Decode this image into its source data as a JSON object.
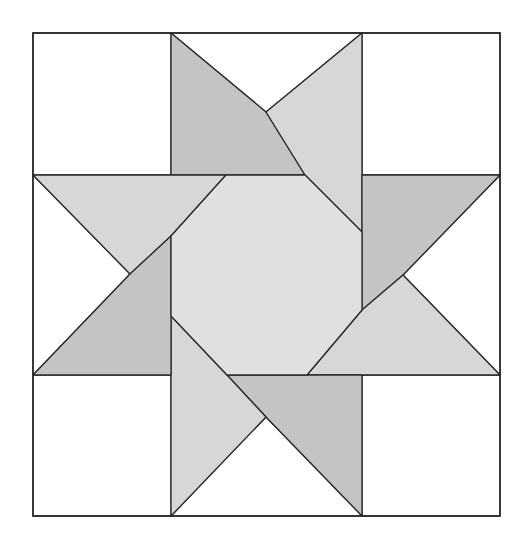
{
  "diagram": {
    "colors": {
      "background": "#ffffff",
      "white": "#ffffff",
      "dark": "#c4c4c4",
      "light": "#d7d7d7",
      "center": "#e0e0e0",
      "stroke": "#2a2a2a"
    },
    "grid": {
      "x": [
        33,
        171,
        362,
        500
      ],
      "y": [
        33,
        175,
        375,
        516
      ]
    },
    "pieces": [
      {
        "name": "corner-top-left",
        "fill": "white",
        "points": "33,33 171,33 171,175 33,175"
      },
      {
        "name": "corner-top-right",
        "fill": "white",
        "points": "362,33 500,33 500,175 362,175"
      },
      {
        "name": "corner-bottom-left",
        "fill": "white",
        "points": "33,375 171,375 171,516 33,516"
      },
      {
        "name": "corner-bottom-right",
        "fill": "white",
        "points": "362,375 500,375 500,516 362,516"
      },
      {
        "name": "top-background-triangle",
        "fill": "white",
        "points": "171,33 362,33 266,112"
      },
      {
        "name": "top-star-point-dark",
        "fill": "dark",
        "points": "171,33 266,112 305,175 171,175"
      },
      {
        "name": "top-star-point-light",
        "fill": "light",
        "points": "362,33 362,232 305,175 266,112"
      },
      {
        "name": "right-background-triangle",
        "fill": "white",
        "points": "500,175 500,375 403,275"
      },
      {
        "name": "right-star-point-dark",
        "fill": "dark",
        "points": "362,175 500,175 403,275 362,310"
      },
      {
        "name": "right-star-point-light",
        "fill": "light",
        "points": "500,375 307,375 362,310 403,275"
      },
      {
        "name": "bottom-background-triangle",
        "fill": "white",
        "points": "171,516 362,516 266,417"
      },
      {
        "name": "bottom-star-point-dark",
        "fill": "dark",
        "points": "362,516 266,417 227,375 362,375"
      },
      {
        "name": "bottom-star-point-light",
        "fill": "light",
        "points": "171,516 171,316 227,375 266,417"
      },
      {
        "name": "left-background-triangle",
        "fill": "white",
        "points": "33,175 33,375 130,274"
      },
      {
        "name": "left-star-point-light",
        "fill": "light",
        "points": "33,175 226,175 171,236 130,274"
      },
      {
        "name": "left-star-point-dark",
        "fill": "dark",
        "points": "33,375 130,274 171,236 171,375"
      },
      {
        "name": "center-octagon",
        "fill": "center",
        "points": "226,175 305,175 362,232 362,310 307,375 227,375 171,316 171,236"
      }
    ],
    "outline": {
      "name": "block-outline",
      "x": 33,
      "y": 33,
      "width": 467,
      "height": 483
    }
  }
}
